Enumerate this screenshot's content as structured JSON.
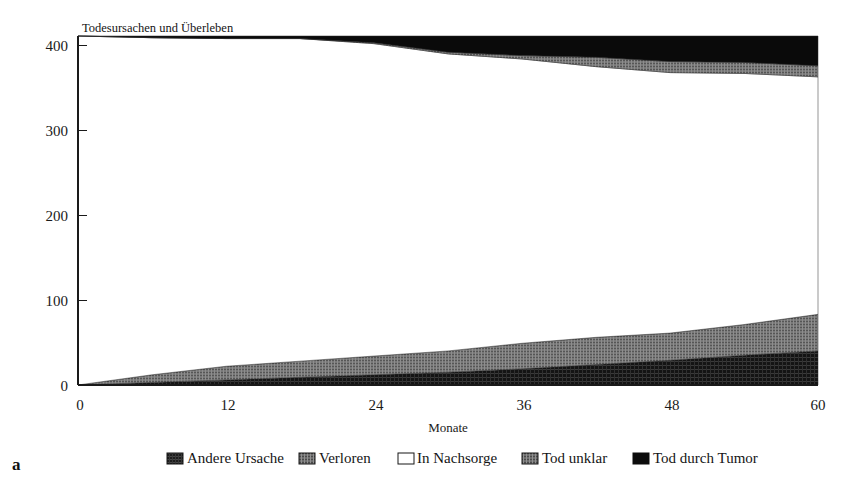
{
  "figure": {
    "panel_letter": "a",
    "title": "Todesursachen und Überleben"
  },
  "chart_data": {
    "type": "area",
    "title": "Todesursachen und Überleben",
    "xlabel": "Monate",
    "ylabel": "",
    "xlim": [
      0,
      60
    ],
    "ylim": [
      0,
      410
    ],
    "xticks": [
      0,
      12,
      24,
      36,
      48,
      60
    ],
    "xtick_labels": [
      "0",
      "12",
      "24",
      "36",
      "48",
      "60"
    ],
    "yticks": [
      0,
      100,
      200,
      300,
      400
    ],
    "ytick_labels": [
      "0",
      "100",
      "200",
      "300",
      "400"
    ],
    "grid": false,
    "stacked": true,
    "legend_position": "bottom",
    "x": [
      0,
      6,
      12,
      18,
      24,
      30,
      36,
      42,
      48,
      54,
      60
    ],
    "series": [
      {
        "name": "Andere Ursache",
        "pattern": "dark-hatch",
        "color": "#1b1b1b",
        "values": [
          0,
          3,
          6,
          9,
          12,
          15,
          19,
          24,
          29,
          35,
          40
        ]
      },
      {
        "name": "Verloren",
        "pattern": "grey-hatch",
        "color": "#6f6f6f",
        "values": [
          0,
          9,
          16,
          19,
          22,
          25,
          30,
          32,
          32,
          36,
          43
        ]
      },
      {
        "name": "In Nachsorge",
        "pattern": "solid-white",
        "color": "#ffffff",
        "values": [
          410,
          396,
          385,
          379,
          367,
          349,
          334,
          318,
          306,
          295,
          279
        ]
      },
      {
        "name": "Tod unklar",
        "pattern": "grey-hatch",
        "color": "#6f6f6f",
        "values": [
          0,
          0,
          0,
          0,
          1,
          2,
          4,
          11,
          13,
          13,
          13
        ]
      },
      {
        "name": "Tod durch Tumor",
        "pattern": "solid-black",
        "color": "#0a0a0a",
        "values": [
          0,
          2,
          3,
          3,
          8,
          19,
          23,
          25,
          30,
          31,
          35
        ]
      }
    ],
    "total_cohort": 410,
    "legend": [
      {
        "label": "Andere Ursache",
        "swatch": "dark-hatch"
      },
      {
        "label": "Verloren",
        "swatch": "grey-hatch"
      },
      {
        "label": "In Nachsorge",
        "swatch": "solid-white"
      },
      {
        "label": "Tod unklar",
        "swatch": "grey-hatch"
      },
      {
        "label": "Tod durch Tumor",
        "swatch": "solid-black"
      }
    ]
  },
  "axes": {
    "x_title": "Monate",
    "x_labels": [
      "0",
      "12",
      "24",
      "36",
      "48",
      "60"
    ],
    "y_labels": [
      "400",
      "300",
      "200",
      "100",
      "0"
    ]
  },
  "legend_items": [
    {
      "label": "Andere Ursache"
    },
    {
      "label": "Verloren"
    },
    {
      "label": "In Nachsorge"
    },
    {
      "label": "Tod unklar"
    },
    {
      "label": "Tod durch Tumor"
    }
  ]
}
